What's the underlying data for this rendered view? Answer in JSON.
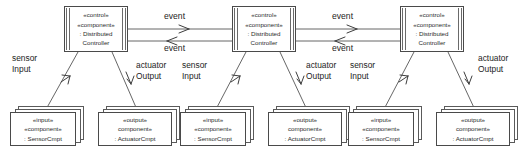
{
  "diagram": {
    "background_color": "#ffffff",
    "line_color": "#4a4a4a",
    "text_color": "#1d1d1d"
  },
  "stereotypes": {
    "control": "«control»",
    "component": "«component»",
    "component_noguillemet": "component»",
    "input": "«input»",
    "output": "«output»"
  },
  "controllers": [
    {
      "id": "controller-1",
      "stereotype_role": "«control»",
      "stereotype_kind": "«component»",
      "instance_line1": ": Distributed",
      "instance_line2": "Controller"
    },
    {
      "id": "controller-2",
      "stereotype_role": "«control»",
      "stereotype_kind": "«component»",
      "instance_line1": ": Distributed",
      "instance_line2": "Controller"
    },
    {
      "id": "controller-3",
      "stereotype_role": "«control»",
      "stereotype_kind": "«component»",
      "instance_line1": ": Distributed",
      "instance_line2": "Controller"
    }
  ],
  "sensors": [
    {
      "id": "sensor-1",
      "stereotype_role": "«input»",
      "stereotype_kind": "«component»",
      "instance": ": SensorCmpt"
    },
    {
      "id": "sensor-2",
      "stereotype_role": "«input»",
      "stereotype_kind": "«component»",
      "instance": ": SensorCmpt"
    },
    {
      "id": "sensor-3",
      "stereotype_role": "«input»",
      "stereotype_kind": "«component»",
      "instance": ": SensorCmpt"
    }
  ],
  "actuators": [
    {
      "id": "actuator-1",
      "stereotype_role": "«output»",
      "stereotype_kind": "component»",
      "instance": ": ActuatorCmpt"
    },
    {
      "id": "actuator-2",
      "stereotype_role": "«output»",
      "stereotype_kind": "component»",
      "instance": ": ActuatorCmpt"
    },
    {
      "id": "actuator-3",
      "stereotype_role": "«output»",
      "stereotype_kind": "component»",
      "instance": ": ActuatorCmpt"
    }
  ],
  "connector_labels": {
    "sensor_input": {
      "line1": "sensor",
      "line2": "Input"
    },
    "actuator_output": {
      "line1": "actuator",
      "line2": "Output"
    },
    "event": "event"
  },
  "event_links": [
    {
      "id": "event-link-1",
      "from": "controller-1",
      "to": "controller-2",
      "forward_label": "event",
      "forward_direction": "right",
      "reverse_label": "event",
      "reverse_direction": "left"
    },
    {
      "id": "event-link-2",
      "from": "controller-2",
      "to": "controller-3",
      "forward_label": "event",
      "forward_direction": "right",
      "reverse_label": "event",
      "reverse_direction": "left"
    }
  ],
  "sensor_links": [
    {
      "id": "sensor-link-1",
      "label_line1": "sensor",
      "label_line2": "Input",
      "arrow_direction": "up-right"
    },
    {
      "id": "sensor-link-2",
      "label_line1": "sensor",
      "label_line2": "Input",
      "arrow_direction": "up-right"
    },
    {
      "id": "sensor-link-3",
      "label_line1": "sensor",
      "label_line2": "Input",
      "arrow_direction": "up-right"
    }
  ],
  "actuator_links": [
    {
      "id": "actuator-link-1",
      "label_line1": "actuator",
      "label_line2": "Output",
      "arrow_direction": "down"
    },
    {
      "id": "actuator-link-2",
      "label_line1": "actuator",
      "label_line2": "Output",
      "arrow_direction": "down"
    },
    {
      "id": "actuator-link-3",
      "label_line1": "actuator",
      "label_line2": "Output",
      "arrow_direction": "down"
    }
  ]
}
